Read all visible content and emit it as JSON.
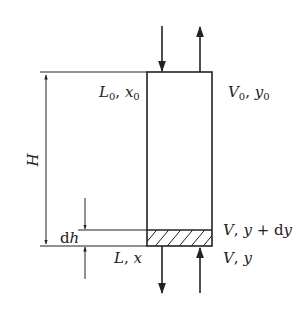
{
  "diagram": {
    "type": "packed-column-differential-element",
    "colors": {
      "stroke": "#222222",
      "background": "#ffffff"
    },
    "labels": {
      "top_left": {
        "main": "L",
        "sub": "0",
        "sep": ", ",
        "var": "x",
        "var_sub": "0"
      },
      "top_right": {
        "main": "V",
        "sub": "0",
        "sep": ", ",
        "var": "y",
        "var_sub": "0"
      },
      "height": "H",
      "element_height": {
        "prefix": "d",
        "var": "h"
      },
      "element_top_right": {
        "main": "V",
        "sep": ", ",
        "var": "y",
        "plus": " + d",
        "var2": "y"
      },
      "bottom_left": {
        "main": "L",
        "sep": ", ",
        "var": "x"
      },
      "bottom_right": {
        "main": "V",
        "sep": ", ",
        "var": "y"
      }
    },
    "flows": [
      {
        "name": "liquid-in-top",
        "direction": "down"
      },
      {
        "name": "vapor-out-top",
        "direction": "up"
      },
      {
        "name": "liquid-out-bottom",
        "direction": "down"
      },
      {
        "name": "vapor-in-bottom",
        "direction": "up"
      }
    ]
  }
}
